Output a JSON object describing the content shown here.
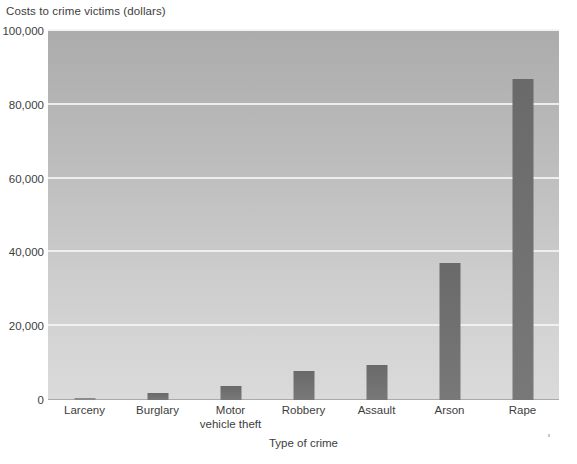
{
  "chart_data": {
    "type": "bar",
    "title": "",
    "ylabel": "Costs to crime victims (dollars)",
    "xlabel": "Type of crime",
    "categories": [
      "Larceny",
      "Burglary",
      "Motor vehicle theft",
      "Robbery",
      "Assault",
      "Arson",
      "Rape"
    ],
    "category_lines": [
      [
        "Larceny"
      ],
      [
        "Burglary"
      ],
      [
        "Motor",
        "vehicle theft"
      ],
      [
        "Robbery"
      ],
      [
        "Assault"
      ],
      [
        "Arson"
      ],
      [
        "Rape"
      ]
    ],
    "values": [
      370,
      1800,
      3700,
      7900,
      9400,
      37000,
      87000
    ],
    "ylim": [
      0,
      100000
    ],
    "y_ticks": [
      0,
      20000,
      40000,
      60000,
      80000,
      100000
    ],
    "y_tick_labels": [
      "0",
      "20,000",
      "40,000",
      "60,000",
      "80,000",
      "100,000"
    ],
    "grid": true,
    "legend": "none",
    "bar_color": "#707070",
    "plot_background_top": "#acacac",
    "plot_background_bottom": "#dadada",
    "gridline_color": "#f2f2f2"
  },
  "artifacts": {
    "corner_mark": ""
  }
}
